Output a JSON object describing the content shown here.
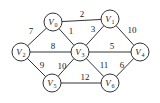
{
  "graph": {
    "nodes": [
      {
        "id": "V0",
        "label": "V",
        "sub": "0",
        "x": 53,
        "y": 22
      },
      {
        "id": "V1",
        "label": "V",
        "sub": "1",
        "x": 110,
        "y": 19
      },
      {
        "id": "V2",
        "label": "V",
        "sub": "2",
        "x": 21,
        "y": 52
      },
      {
        "id": "V3",
        "label": "V",
        "sub": "3",
        "x": 80,
        "y": 52
      },
      {
        "id": "V4",
        "label": "V",
        "sub": "4",
        "x": 140,
        "y": 52
      },
      {
        "id": "V5",
        "label": "V",
        "sub": "5",
        "x": 52,
        "y": 83
      },
      {
        "id": "V6",
        "label": "V",
        "sub": "6",
        "x": 110,
        "y": 83
      }
    ],
    "edges": [
      {
        "from": "V0",
        "to": "V1",
        "weight": "2",
        "lx": 82,
        "ly": 17
      },
      {
        "from": "V0",
        "to": "V2",
        "weight": "7",
        "lx": 31,
        "ly": 34
      },
      {
        "from": "V0",
        "to": "V3",
        "weight": "1",
        "lx": 71,
        "ly": 34
      },
      {
        "from": "V1",
        "to": "V3",
        "weight": "3",
        "lx": 93,
        "ly": 32
      },
      {
        "from": "V1",
        "to": "V4",
        "weight": "10",
        "lx": 132,
        "ly": 33
      },
      {
        "from": "V2",
        "to": "V3",
        "weight": "8",
        "lx": 53,
        "ly": 49
      },
      {
        "from": "V3",
        "to": "V4",
        "weight": "5",
        "lx": 112,
        "ly": 49
      },
      {
        "from": "V2",
        "to": "V5",
        "weight": "9",
        "lx": 42,
        "ly": 68
      },
      {
        "from": "V3",
        "to": "V5",
        "weight": "10",
        "lx": 62,
        "ly": 69
      },
      {
        "from": "V3",
        "to": "V6",
        "weight": "11",
        "lx": 104,
        "ly": 68
      },
      {
        "from": "V4",
        "to": "V6",
        "weight": "6",
        "lx": 122,
        "ly": 68
      },
      {
        "from": "V5",
        "to": "V6",
        "weight": "12",
        "lx": 85,
        "ly": 80
      }
    ]
  }
}
